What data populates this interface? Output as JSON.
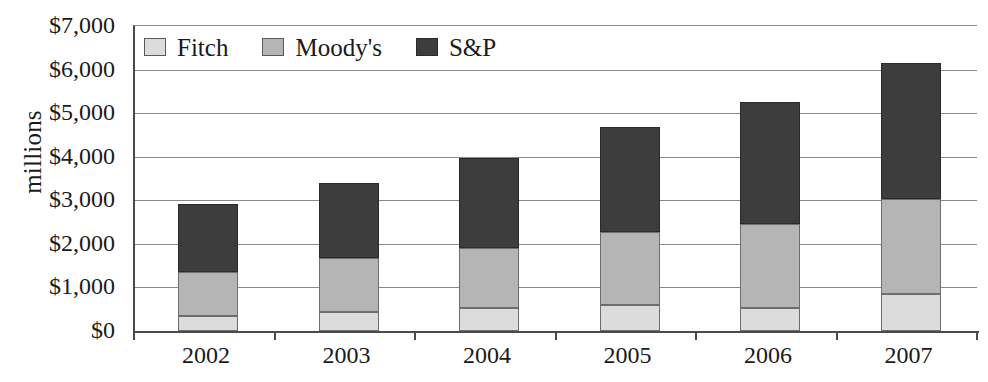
{
  "chart_data": {
    "type": "bar",
    "subtype": "stacked-bar",
    "title": "",
    "xlabel": "",
    "ylabel": "millions",
    "categories": [
      "2002",
      "2003",
      "2004",
      "2005",
      "2006",
      "2007"
    ],
    "series": [
      {
        "name": "Fitch",
        "color": "#dcdcdc",
        "values": [
          345,
          435,
          530,
          595,
          530,
          850
        ]
      },
      {
        "name": "Moody's",
        "color": "#b5b5b5",
        "values": [
          1010,
          1240,
          1375,
          1675,
          1930,
          2180
        ]
      },
      {
        "name": "S&P",
        "color": "#3d3d3d",
        "values": [
          1560,
          1720,
          2065,
          2410,
          2800,
          3120
        ]
      }
    ],
    "totals": [
      2915,
      3395,
      3970,
      4680,
      5260,
      6150
    ],
    "ylim": [
      0,
      7000
    ],
    "ytick_values": [
      0,
      1000,
      2000,
      3000,
      4000,
      5000,
      6000,
      7000
    ],
    "ytick_labels": [
      "$0",
      "$1,000",
      "$2,000",
      "$3,000",
      "$4,000",
      "$5,000",
      "$6,000",
      "$7,000"
    ],
    "grid": true,
    "grid_axis": "y",
    "legend_position": "top-left-inside",
    "value_unit": "millions of dollars",
    "currency_symbol": "$"
  },
  "legend": {
    "items": [
      {
        "label": "Fitch",
        "swatch": "legend-swatch-fitch"
      },
      {
        "label": "Moody's",
        "swatch": "legend-swatch-moodys"
      },
      {
        "label": "S&P",
        "swatch": "legend-swatch-sp"
      }
    ]
  },
  "axes": {
    "y_title": "millions"
  }
}
